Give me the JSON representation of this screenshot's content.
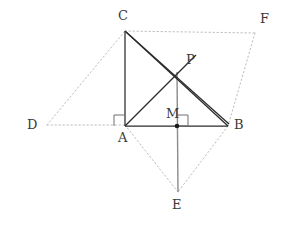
{
  "figure": {
    "type": "geometry-diagram",
    "width": 281,
    "height": 229,
    "background_color": "#ffffff",
    "stroke_colors": {
      "solid_dark": "#2a2a2a",
      "solid_gray": "#8c8c8c",
      "dotted_light": "#bdbdbd",
      "label_text": "#3a3a3a",
      "point_fill": "#1a1a1a"
    },
    "points": [
      {
        "name": "A",
        "label": "A",
        "x": 125,
        "y": 125,
        "label_x": 118,
        "label_y": 131
      },
      {
        "name": "B",
        "label": "B",
        "x": 228,
        "y": 126,
        "label_x": 234,
        "label_y": 119
      },
      {
        "name": "C",
        "label": "C",
        "x": 125,
        "y": 31,
        "label_x": 118,
        "label_y": 9
      },
      {
        "name": "D",
        "label": "D",
        "x": 47,
        "y": 125,
        "label_x": 27,
        "label_y": 118
      },
      {
        "name": "E",
        "label": "E",
        "x": 178,
        "y": 192,
        "label_x": 172,
        "label_y": 198
      },
      {
        "name": "F",
        "label": "F",
        "x": 255,
        "y": 33,
        "label_x": 260,
        "label_y": 12
      },
      {
        "name": "M",
        "label": "M",
        "x": 177,
        "y": 126,
        "label_x": 166,
        "label_y": 107
      },
      {
        "name": "P",
        "label": "P",
        "x": 177,
        "y": 74,
        "label_x": 186,
        "label_y": 53
      }
    ],
    "segments": [
      {
        "name": "segment-C-A",
        "from": "C",
        "to": "A",
        "style": "solid-dark"
      },
      {
        "name": "segment-A-B",
        "from": "A",
        "to": "B",
        "style": "solid-dark"
      },
      {
        "name": "segment-C-B",
        "from": "C",
        "to": "B",
        "style": "solid-dark"
      },
      {
        "name": "segment-C-P-B",
        "from": "C",
        "to": "B",
        "style": "solid-dark-offset"
      },
      {
        "name": "segment-A-P",
        "from": "A",
        "to": "P",
        "style": "solid-dark"
      },
      {
        "name": "segment-P-M-E",
        "from": "P",
        "to": "E",
        "style": "solid-gray"
      },
      {
        "name": "segment-D-C",
        "from": "D",
        "to": "C",
        "style": "dotted"
      },
      {
        "name": "segment-D-A",
        "from": "D",
        "to": "A",
        "style": "dotted"
      },
      {
        "name": "segment-C-F",
        "from": "C",
        "to": "F",
        "style": "dotted"
      },
      {
        "name": "segment-F-B",
        "from": "F",
        "to": "B",
        "style": "dotted"
      },
      {
        "name": "segment-A-E",
        "from": "A",
        "to": "E",
        "style": "dotted"
      },
      {
        "name": "segment-B-E",
        "from": "B",
        "to": "E",
        "style": "dotted"
      }
    ],
    "right_angle_markers": [
      {
        "name": "right-angle-at-A",
        "vertex": "A",
        "size": 10,
        "orientation": "up-left"
      },
      {
        "name": "right-angle-at-M",
        "vertex": "M",
        "size": 11,
        "orientation": "down-right"
      }
    ],
    "marked_points": [
      {
        "name": "point-marker-M",
        "x": 177,
        "y": 126,
        "radius": 2.2
      }
    ]
  }
}
